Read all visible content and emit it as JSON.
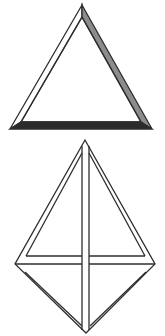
{
  "figure": {
    "description": "Two beveled frame shapes: a shaded triangular frame above a double-line diamond (rhombus) frame with cross bars",
    "shapes": [
      {
        "id": "triangle-frame",
        "label": "Triangular bevel frame",
        "faces": {
          "left": "light",
          "right": "medium",
          "bottom": "dark"
        }
      },
      {
        "id": "diamond-frame",
        "label": "Diamond frame with vertical and horizontal bars",
        "faces": {
          "all": "outline"
        }
      }
    ],
    "colors": {
      "background": "#ffffff",
      "line": "#2e2e2e",
      "face_light": "#ffffff",
      "face_medium": "#8c8c8c",
      "face_dark": "#2b2b2b"
    }
  }
}
